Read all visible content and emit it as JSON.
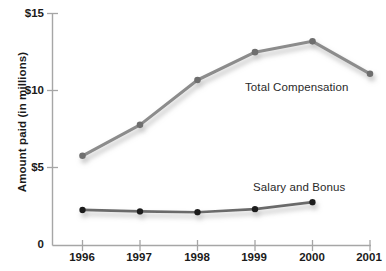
{
  "chart_data": {
    "type": "line",
    "title": "",
    "xlabel": "",
    "ylabel": "Amount paid (in millions)",
    "x": [
      "1996",
      "1997",
      "1998",
      "1999",
      "2000",
      "2001"
    ],
    "xlim": [
      1996,
      2001
    ],
    "ylim": [
      0,
      15
    ],
    "y_ticks": [
      0,
      5,
      10,
      15
    ],
    "y_tick_labels": [
      "0",
      "$5",
      "$10",
      "$15"
    ],
    "grid": false,
    "legend_position": "inline-annotations",
    "series": [
      {
        "name": "Total Compensation",
        "color": "#8c8c8c",
        "marker_color": "#6e6e6e",
        "x": [
          "1996",
          "1997",
          "1998",
          "1999",
          "2000",
          "2001"
        ],
        "values": [
          5.8,
          7.8,
          10.7,
          12.5,
          13.2,
          11.1
        ],
        "annotation": "Total Compensation"
      },
      {
        "name": "Salary and Bonus",
        "color": "#6b6b6b",
        "marker_color": "#1f1f1f",
        "x": [
          "1996",
          "1997",
          "1998",
          "1999",
          "2000"
        ],
        "values": [
          2.3,
          2.2,
          2.15,
          2.35,
          2.8
        ],
        "annotation": "Salary and Bonus"
      }
    ],
    "annotations": [
      {
        "text": "Total Compensation",
        "x": 245,
        "y": 88
      },
      {
        "text": "Salary and Bonus",
        "x": 253,
        "y": 188
      }
    ]
  },
  "axis": {
    "y_label": "Amount paid (in millions)",
    "y_tick_0": "0",
    "y_tick_5": "$5",
    "y_tick_10": "$10",
    "y_tick_15": "$15",
    "x_tick_1996": "1996",
    "x_tick_1997": "1997",
    "x_tick_1998": "1998",
    "x_tick_1999": "1999",
    "x_tick_2000": "2000",
    "x_tick_2001": "2001"
  },
  "labels": {
    "total_compensation": "Total Compensation",
    "salary_and_bonus": "Salary and Bonus"
  },
  "colors": {
    "axis": "#a6a6a6",
    "text": "#1b1b1b",
    "total_line": "#8c8c8c",
    "total_marker": "#6e6e6e",
    "salary_line": "#6b6b6b",
    "salary_marker": "#1f1f1f",
    "shadow": "#cfcfcf",
    "background": "#ffffff"
  }
}
